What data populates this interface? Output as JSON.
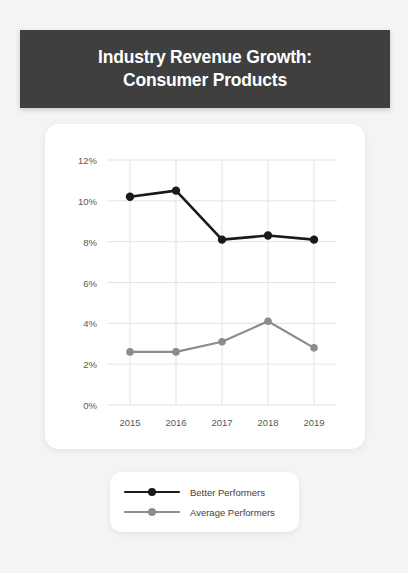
{
  "poster": {
    "background_color": "#f4f4f4"
  },
  "header": {
    "title": "Industry Revenue Growth:\nConsumer Products",
    "background_color": "#3f3f3f",
    "text_color": "#ffffff"
  },
  "legend": {
    "position": "bottom",
    "items": [
      {
        "label": "Better Performers",
        "color": "#1a1a1a"
      },
      {
        "label": "Average Performers",
        "color": "#8c8c8c"
      }
    ]
  },
  "chart_data": {
    "type": "line",
    "title": "Industry Revenue Growth: Consumer Products",
    "xlabel": "",
    "ylabel": "",
    "categories": [
      "2015",
      "2016",
      "2017",
      "2018",
      "2019"
    ],
    "x": [
      2015,
      2016,
      2017,
      2018,
      2019
    ],
    "ylim": [
      0,
      12
    ],
    "ytick_labels": [
      "0%",
      "2%",
      "4%",
      "6%",
      "8%",
      "10%",
      "12%"
    ],
    "ytick_values": [
      0,
      2,
      4,
      6,
      8,
      10,
      12
    ],
    "grid": true,
    "grid_color": "#e3e3e3",
    "legend_position": "below-chart",
    "series": [
      {
        "name": "Better Performers",
        "color": "#1a1a1a",
        "values": [
          10.2,
          10.5,
          8.1,
          8.3,
          8.1
        ]
      },
      {
        "name": "Average Performers",
        "color": "#8c8c8c",
        "values": [
          2.6,
          2.6,
          3.1,
          4.1,
          2.8
        ]
      }
    ]
  }
}
